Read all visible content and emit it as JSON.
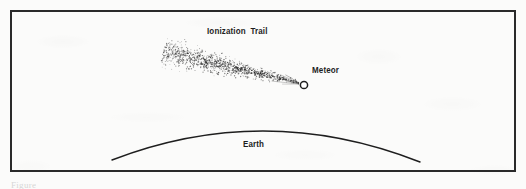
{
  "figure": {
    "caption_fragment": "Figure",
    "background_color": "#fbfbfa",
    "ink_color": "#1e1e1e",
    "border_color": "#2a2a2a",
    "border_width_px": 2,
    "width_px": 526,
    "height_px": 189
  },
  "labels": {
    "ionization_trail": "Ionization Trail",
    "meteor": "Meteor",
    "earth": "Earth"
  },
  "chart_data": {
    "type": "diagram",
    "elements": [
      {
        "name": "frame",
        "kind": "rectangle",
        "x": 10,
        "y": 10,
        "width": 506,
        "height": 162,
        "stroke": "#2a2a2a",
        "stroke_width": 2,
        "fill": "none"
      },
      {
        "name": "earth-horizon",
        "kind": "arc",
        "label": "Earth",
        "start": [
          112,
          160
        ],
        "apex": [
          265,
          120
        ],
        "end": [
          420,
          162
        ],
        "stroke": "#1e1e1e",
        "stroke_width": 1.4
      },
      {
        "name": "meteor-head",
        "kind": "circle",
        "label": "Meteor",
        "cx": 304,
        "cy": 85,
        "r": 3.6,
        "stroke": "#1e1e1e",
        "stroke_width": 1.4,
        "fill": "#ffffff"
      },
      {
        "name": "ionization-trail",
        "kind": "stipple-cone",
        "label": "Ionization Trail",
        "tip": [
          300,
          83
        ],
        "tail_center": [
          163,
          52
        ],
        "tip_half_width": 2,
        "tail_half_width": 21,
        "dot_count": 1400,
        "dot_color": "#2b2b2b"
      },
      {
        "name": "trail-streak-lines",
        "kind": "converging-lines",
        "from_x": 258,
        "to_x": 301,
        "line_count": 7,
        "stroke": "#2b2b2b",
        "stroke_width": 0.45
      }
    ],
    "annotations": [
      {
        "text": "Ionization Trail",
        "x": 207,
        "y": 32,
        "anchor": "start"
      },
      {
        "text": "Meteor",
        "x": 312,
        "y": 71,
        "anchor": "start"
      },
      {
        "text": "Earth",
        "x": 243,
        "y": 145,
        "anchor": "start"
      }
    ]
  }
}
